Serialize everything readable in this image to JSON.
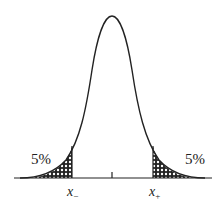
{
  "diagram": {
    "type": "normal-distribution-two-tailed",
    "left_tail": {
      "label": "5%",
      "bound_label": "x",
      "bound_sub": "−"
    },
    "right_tail": {
      "label": "5%",
      "bound_label": "x",
      "bound_sub": "+"
    },
    "center_tick": "mean",
    "colors": {
      "stroke": "#222222",
      "hatch": "#222222",
      "background": "#ffffff"
    }
  }
}
